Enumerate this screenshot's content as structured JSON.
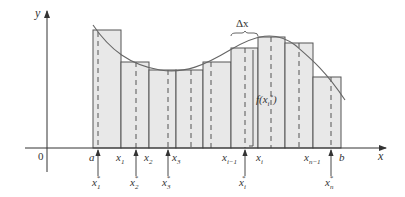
{
  "figure": {
    "axes": {
      "x_label": "x",
      "y_label": "y",
      "origin_label": "0"
    },
    "annotations": {
      "delta_x": "Δx",
      "f_label_main": "f(x",
      "f_label_sub": "i",
      "f_label_sup": "*",
      "f_label_close": ")"
    },
    "partition_labels": [
      {
        "main": "a",
        "sub": ""
      },
      {
        "main": "x",
        "sub": "1"
      },
      {
        "main": "x",
        "sub": "2"
      },
      {
        "main": "x",
        "sub": "3"
      },
      {
        "main": "x",
        "sub": "i−1"
      },
      {
        "main": "x",
        "sub": "i"
      },
      {
        "main": "x",
        "sub": "n−1"
      },
      {
        "main": "b",
        "sub": ""
      }
    ],
    "sample_labels": [
      {
        "main": "x",
        "sub": "1",
        "sup": "*"
      },
      {
        "main": "x",
        "sub": "2",
        "sup": "*"
      },
      {
        "main": "x",
        "sub": "3",
        "sup": "*"
      },
      {
        "main": "x",
        "sub": "i",
        "sup": "*"
      },
      {
        "main": "x",
        "sub": "n",
        "sup": "*"
      }
    ],
    "colors": {
      "rect_fill": "#e8e8e8",
      "stroke": "#555555",
      "curve": "#666666"
    }
  }
}
